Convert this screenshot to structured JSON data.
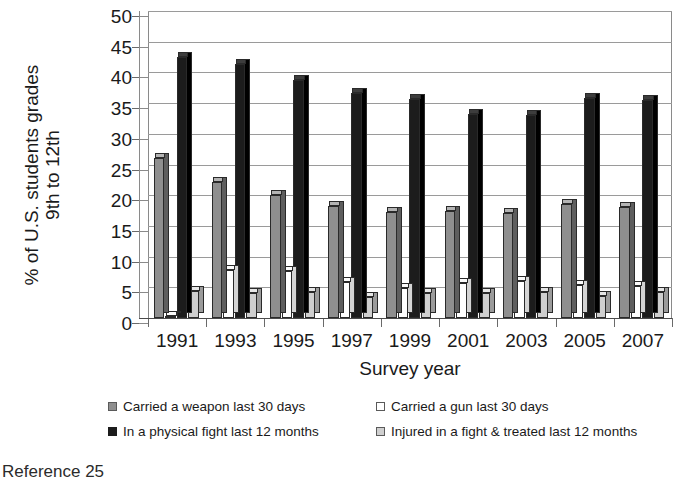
{
  "chart_data": {
    "type": "bar",
    "title": "",
    "xlabel": "Survey year",
    "ylabel_lines": [
      "% of U.S. students grades",
      "9th to 12th"
    ],
    "categories": [
      "1991",
      "1993",
      "1995",
      "1997",
      "1999",
      "2001",
      "2003",
      "2005",
      "2007"
    ],
    "ylim": [
      0,
      50
    ],
    "yticks": [
      0,
      5,
      10,
      15,
      20,
      25,
      30,
      35,
      40,
      45,
      50
    ],
    "grid": true,
    "legend_position": "bottom",
    "series": [
      {
        "name": "Carried a weapon last 30 days",
        "color": "#8f8f8f",
        "values": [
          26.1,
          22.1,
          20.0,
          18.3,
          17.3,
          17.4,
          17.1,
          18.5,
          18.0
        ]
      },
      {
        "name": "Carried a gun last 30 days",
        "color": "#ffffff",
        "values": [
          0.4,
          7.9,
          7.6,
          5.9,
          4.9,
          5.7,
          6.1,
          5.4,
          5.2
        ]
      },
      {
        "name": "In a physical fight last 12 months",
        "color": "#1c1c1c",
        "values": [
          42.5,
          41.4,
          38.7,
          36.6,
          35.7,
          33.2,
          33.0,
          35.9,
          35.5
        ]
      },
      {
        "name": "Injured in a fight & treated last 12 months",
        "color": "#cfcfcf",
        "values": [
          4.4,
          4.0,
          4.2,
          3.5,
          4.0,
          4.0,
          4.2,
          3.6,
          4.2
        ]
      }
    ]
  },
  "footnote": "Reference 25"
}
